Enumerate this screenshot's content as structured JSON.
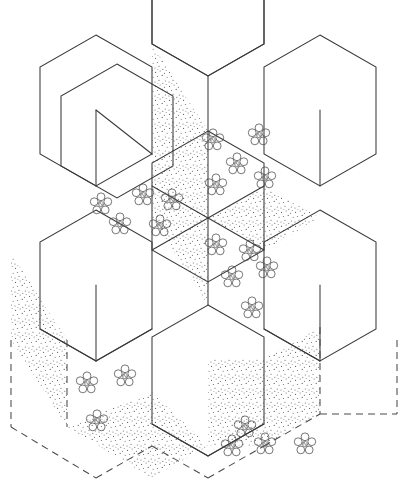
{
  "figure": {
    "canvas": {
      "width": 404,
      "height": 491
    },
    "background_color": "#ffffff",
    "line_color": "#3a3a3a",
    "dash_color": "#4a4a4a",
    "stipple_color": "#555555",
    "rosette_color": "#4a4a4a",
    "geometry": {
      "center": {
        "x": 208,
        "y": 218
      },
      "hex_radius": 101,
      "hex_count": 7,
      "hex_orientation": "pointy-top",
      "hex_centers": [
        {
          "name": "center",
          "x": 208,
          "y": 218
        },
        {
          "name": "top",
          "x": 208,
          "y": 43
        },
        {
          "name": "upper-left",
          "x": 117,
          "y": 165
        },
        {
          "name": "upper-right",
          "x": 299,
          "y": 165
        },
        {
          "name": "lower-left",
          "x": 117,
          "y": 340
        },
        {
          "name": "lower-right",
          "x": 299,
          "y": 340
        },
        {
          "name": "bottom",
          "x": 208,
          "y": 393
        }
      ]
    },
    "faces": [
      {
        "id": "center-left-wall",
        "shading": "stipple",
        "rosettes": 2
      },
      {
        "id": "center-right-wall",
        "shading": "plain",
        "rosettes": 5
      },
      {
        "id": "center-top",
        "shading": "plain",
        "rosettes": 0
      },
      {
        "id": "upper-left-top",
        "shading": "plain",
        "rosettes": 5
      },
      {
        "id": "upper-right-top",
        "shading": "stipple",
        "rosettes": 2
      },
      {
        "id": "top-hex-left-wall",
        "shading": "stipple",
        "rosettes": 0
      },
      {
        "id": "lower-left-wall",
        "shading": "stipple",
        "rosettes": 0
      },
      {
        "id": "lower-left-floor",
        "shading": "stipple",
        "rosettes": 2
      },
      {
        "id": "lower-left-front",
        "shading": "plain",
        "rosettes": 3
      },
      {
        "id": "lower-right-wall",
        "shading": "stipple",
        "rosettes": 0
      },
      {
        "id": "lower-right-floor",
        "shading": "plain",
        "rosettes": 4
      },
      {
        "id": "bottom-hex-top",
        "shading": "plain",
        "rosettes": 0
      }
    ],
    "legend": {
      "stipple_label": "stippled face",
      "rosette_label": "rosette / shrub symbol",
      "solid_edge_label": "visible edge",
      "dashed_edge_label": "hidden edge"
    },
    "counts": {
      "hexagons": 7,
      "stippled_faces": 7,
      "rosettes_total": 23,
      "dashed_edges": 6
    }
  }
}
